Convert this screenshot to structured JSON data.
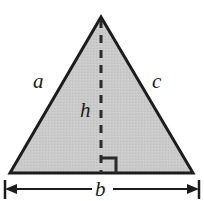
{
  "figure": {
    "type": "geometry-diagram",
    "background_color": "#ffffff",
    "fill_color": "#c9c9c9",
    "stroke_color": "#1c1c1c",
    "shape": {
      "name": "triangle",
      "vertices": [
        {
          "name": "apex",
          "x": 101,
          "y": 17
        },
        {
          "name": "bottom-left",
          "x": 10,
          "y": 173
        },
        {
          "name": "bottom-right",
          "x": 193,
          "y": 173
        }
      ]
    },
    "altitude": {
      "name": "height-dashed-line",
      "from_x": 101,
      "from_y": 19,
      "to_x": 101,
      "to_y": 173,
      "style": "dashed"
    },
    "right_angle_marker": {
      "name": "right-angle-square",
      "x": 101,
      "y": 173,
      "size": 14,
      "opens": "right"
    },
    "dimension_line": {
      "name": "base-dimension",
      "y": 189,
      "left_x": 10,
      "right_x": 193,
      "arrows": "both",
      "end_ticks": true
    },
    "labels": {
      "side_a": "a",
      "side_c": "c",
      "height": "h",
      "base": "b"
    }
  }
}
